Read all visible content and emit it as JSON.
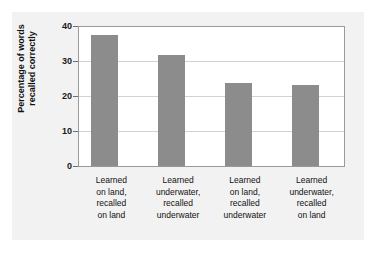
{
  "chart_data": {
    "type": "bar",
    "title": "",
    "subtitle": "",
    "xlabel": "",
    "ylabel": "Percentage of words\nrecalled correctly",
    "ylabel_lines": [
      "Percentage of words",
      "recalled correctly"
    ],
    "categories": [
      "Learned\non land,\nrecalled\non land",
      "Learned\nunderwater,\nrecalled\nunderwater",
      "Learned\non land,\nrecalled\nunderwater",
      "Learned\nunderwater,\nrecalled\non land"
    ],
    "category_lines": [
      [
        "Learned",
        "on land,",
        "recalled",
        "on land"
      ],
      [
        "Learned",
        "underwater,",
        "recalled",
        "underwater"
      ],
      [
        "Learned",
        "on land,",
        "recalled",
        "underwater"
      ],
      [
        "Learned",
        "underwater,",
        "recalled",
        "on land"
      ]
    ],
    "values": [
      37.7,
      32.0,
      24.0,
      23.4
    ],
    "ylim": [
      0,
      40
    ],
    "yticks": [
      0,
      10,
      20,
      30,
      40
    ],
    "ytick_labels": [
      "0",
      "10",
      "20",
      "30",
      "40"
    ],
    "grid": true,
    "grid_axis": "y",
    "legend": false,
    "legend_position": "none",
    "bar_color": "#8c8c8c",
    "plot_background": "#ffffff",
    "panel_background": "#f2f2f2",
    "gridline_color": "#d2d2d2",
    "axis_color": "#9a9a9a"
  }
}
